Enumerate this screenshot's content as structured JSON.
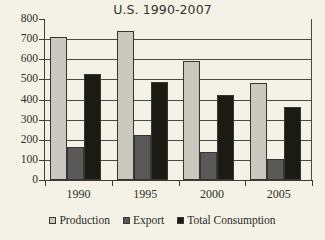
{
  "chart_data": {
    "type": "bar",
    "title": "U.S. 1990-2007",
    "xlabel": "",
    "ylabel": "",
    "categories": [
      "1990",
      "1995",
      "2000",
      "2005"
    ],
    "series": [
      {
        "name": "Production",
        "values": [
          710,
          740,
          590,
          480
        ],
        "color": "#c9c9c1"
      },
      {
        "name": "Export",
        "values": [
          165,
          225,
          140,
          105
        ],
        "color": "#59595a"
      },
      {
        "name": "Total Consumption",
        "values": [
          525,
          485,
          420,
          365
        ],
        "color": "#1b1b15"
      }
    ],
    "ylim": [
      0,
      800
    ],
    "ytick_step": 100,
    "yticks": [
      800,
      700,
      600,
      500,
      400,
      300,
      200,
      100,
      0
    ],
    "ytick_labels": [
      "800",
      "700",
      "600",
      "500",
      "400",
      "300",
      "200",
      "100",
      "0"
    ],
    "grid": true,
    "grid_axis": "y",
    "legend_position": "bottom",
    "legend_entries": [
      "Production",
      "Export",
      "Total Consumption"
    ],
    "background_color": "#f4f2e7",
    "axis_color": "#3d3d36"
  }
}
